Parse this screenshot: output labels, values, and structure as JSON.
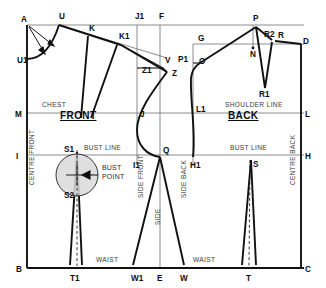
{
  "diagram": {
    "colors": {
      "outline": "#111111",
      "construction": "#6e6e6e",
      "bust_circle_fill": "#d9d9d9",
      "background": "#ffffff"
    },
    "sections": [
      {
        "name": "front",
        "label": "FRONT",
        "x": 60,
        "y": 119
      },
      {
        "name": "back",
        "label": "BACK",
        "x": 228,
        "y": 119
      }
    ],
    "line_labels": [
      {
        "name": "chest-line-label",
        "text": "CHEST",
        "x": 42,
        "y": 107
      },
      {
        "name": "shoulder-line-label",
        "text": "SHOULDER LINE",
        "x": 225,
        "y": 107
      },
      {
        "name": "front-bust-line-label",
        "text": "BUST LINE",
        "x": 84,
        "y": 150
      },
      {
        "name": "back-bust-line-label",
        "text": "BUST LINE",
        "x": 230,
        "y": 150
      },
      {
        "name": "front-waist-line-label",
        "text": "WAIST",
        "x": 96,
        "y": 262
      },
      {
        "name": "back-waist-line-label",
        "text": "WAIST",
        "x": 193,
        "y": 262
      }
    ],
    "vertical_labels": [
      {
        "name": "centre-front-label",
        "text": "CENTRE FRONT",
        "x": 34,
        "y": 185
      },
      {
        "name": "side-front-label",
        "text": "SIDE FRONT",
        "x": 143,
        "y": 198
      },
      {
        "name": "side-label",
        "text": "SIDE",
        "x": 160,
        "y": 225
      },
      {
        "name": "side-back-label",
        "text": "SIDE BACK",
        "x": 186,
        "y": 198
      },
      {
        "name": "centre-back-label",
        "text": "CENTRE BACK",
        "x": 295,
        "y": 185
      }
    ],
    "notes": [
      {
        "name": "bust-point-note-line1",
        "text": "BUST",
        "x": 102,
        "y": 170
      },
      {
        "name": "bust-point-note-line2",
        "text": "POINT",
        "x": 102,
        "y": 179
      }
    ],
    "points": [
      {
        "name": "point-A",
        "label": "A",
        "x": 21,
        "y": 22
      },
      {
        "name": "point-U",
        "label": "U",
        "x": 59,
        "y": 19
      },
      {
        "name": "point-K",
        "label": "K",
        "x": 89,
        "y": 31
      },
      {
        "name": "point-K1",
        "label": "K1",
        "x": 119,
        "y": 39
      },
      {
        "name": "point-J1",
        "label": "J1",
        "x": 135,
        "y": 19
      },
      {
        "name": "point-F",
        "label": "F",
        "x": 159,
        "y": 19
      },
      {
        "name": "point-U1",
        "label": "U1",
        "x": 17,
        "y": 63
      },
      {
        "name": "point-Z1",
        "label": "Z1",
        "x": 142,
        "y": 73
      },
      {
        "name": "point-V",
        "label": "V",
        "x": 165,
        "y": 63
      },
      {
        "name": "point-Z",
        "label": "Z",
        "x": 172,
        "y": 76
      },
      {
        "name": "point-P1",
        "label": "P1",
        "x": 178,
        "y": 62
      },
      {
        "name": "point-O",
        "label": "O",
        "x": 199,
        "y": 64
      },
      {
        "name": "point-G",
        "label": "G",
        "x": 198,
        "y": 41
      },
      {
        "name": "point-P",
        "label": "P",
        "x": 253,
        "y": 21
      },
      {
        "name": "point-R2",
        "label": "R2",
        "x": 266,
        "y": 37
      },
      {
        "name": "point-R",
        "label": "R",
        "x": 278,
        "y": 38
      },
      {
        "name": "point-D",
        "label": "D",
        "x": 303,
        "y": 44
      },
      {
        "name": "point-N",
        "label": "N",
        "x": 253,
        "y": 54
      },
      {
        "name": "point-R1",
        "label": "R1",
        "x": 262,
        "y": 95
      },
      {
        "name": "point-M",
        "label": "M",
        "x": 17,
        "y": 117
      },
      {
        "name": "point-J",
        "label": "J",
        "x": 141,
        "y": 117
      },
      {
        "name": "point-L1",
        "label": "L1",
        "x": 196,
        "y": 113
      },
      {
        "name": "point-L",
        "label": "L",
        "x": 305,
        "y": 117
      },
      {
        "name": "point-I",
        "label": "I",
        "x": 17,
        "y": 159
      },
      {
        "name": "point-S1",
        "label": "S1",
        "x": 67,
        "y": 152
      },
      {
        "name": "point-I1",
        "label": "I1",
        "x": 138,
        "y": 168
      },
      {
        "name": "point-Q",
        "label": "Q",
        "x": 165,
        "y": 153
      },
      {
        "name": "point-H1",
        "label": "H1",
        "x": 195,
        "y": 168
      },
      {
        "name": "point-S",
        "label": "S",
        "x": 253,
        "y": 168
      },
      {
        "name": "point-H",
        "label": "H",
        "x": 305,
        "y": 159
      },
      {
        "name": "point-S2",
        "label": "S2",
        "x": 67,
        "y": 198
      },
      {
        "name": "point-B",
        "label": "B",
        "x": 17,
        "y": 272
      },
      {
        "name": "point-T1",
        "label": "T1",
        "x": 74,
        "y": 281
      },
      {
        "name": "point-W1",
        "label": "W1",
        "x": 137,
        "y": 281
      },
      {
        "name": "point-E",
        "label": "E",
        "x": 160,
        "y": 281
      },
      {
        "name": "point-W",
        "label": "W",
        "x": 182,
        "y": 281
      },
      {
        "name": "point-T",
        "label": "T",
        "x": 249,
        "y": 281
      },
      {
        "name": "point-C",
        "label": "C",
        "x": 305,
        "y": 272
      }
    ]
  }
}
